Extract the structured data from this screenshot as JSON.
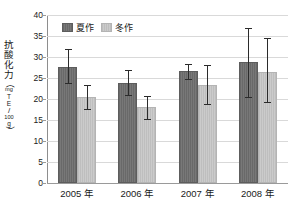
{
  "chart_data": {
    "type": "bar",
    "title": "",
    "subtitle": "",
    "xlabel": "",
    "ylabel": "抗酸化力（mg TE/100 g）",
    "ylabel_parts": {
      "main": [
        "抗",
        "酸",
        "化",
        "力"
      ],
      "unit_open": "（",
      "unit": [
        "mg",
        "T",
        "E",
        "/",
        "100",
        "g"
      ],
      "unit_close": "）"
    },
    "categories": [
      "2005 年",
      "2006 年",
      "2007 年",
      "2008 年"
    ],
    "ylim": [
      0,
      40
    ],
    "yticks": [
      0,
      5,
      10,
      15,
      20,
      25,
      30,
      35,
      40
    ],
    "ytick_labels": [
      "0",
      "5",
      "10",
      "15",
      "20",
      "25",
      "30",
      "35",
      "40"
    ],
    "grid": true,
    "legend_position": "top-center",
    "series": [
      {
        "name": "夏作",
        "color": "#6e6e6e",
        "values": [
          27.6,
          23.8,
          26.7,
          28.8
        ],
        "errors_high": [
          31.9,
          26.9,
          28.3,
          37.0
        ],
        "errors_low": [
          23.8,
          21.0,
          24.8,
          20.5
        ]
      },
      {
        "name": "冬作",
        "color": "#c4c4c4",
        "values": [
          20.5,
          18.0,
          23.3,
          26.4
        ],
        "errors_high": [
          23.4,
          20.8,
          28.0,
          34.5
        ],
        "errors_low": [
          17.6,
          15.3,
          18.8,
          19.3
        ]
      }
    ]
  },
  "legend": {
    "items": [
      {
        "label": "夏作",
        "swatch": "summer-swatch"
      },
      {
        "label": "冬作",
        "swatch": "winter-swatch"
      }
    ]
  },
  "axis": {
    "y_ticks": [
      "40",
      "35",
      "30",
      "25",
      "20",
      "15",
      "10",
      "5",
      "0"
    ],
    "x_ticks": [
      "2005 年",
      "2006 年",
      "2007 年",
      "2008 年"
    ]
  }
}
